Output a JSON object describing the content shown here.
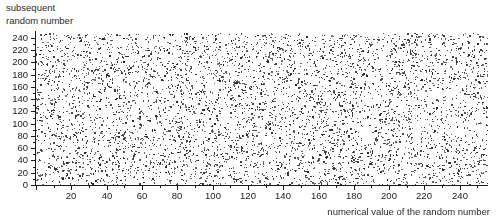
{
  "chart_data": {
    "type": "scatter",
    "title": "",
    "xlabel": "numerical value of the random number",
    "ylabel_lines": [
      "subsequent",
      "random number"
    ],
    "ylabel": "subsequent random number",
    "xlim": [
      0,
      256
    ],
    "ylim": [
      0,
      248
    ],
    "xticks": [
      0,
      20,
      40,
      60,
      80,
      100,
      120,
      140,
      160,
      180,
      200,
      220,
      240
    ],
    "yticks": [
      0,
      20,
      40,
      60,
      80,
      100,
      120,
      140,
      160,
      180,
      200,
      220,
      240
    ],
    "xtick_labels": [
      "",
      "20",
      "40",
      "60",
      "80",
      "100",
      "120",
      "140",
      "160",
      "180",
      "200",
      "220",
      "240"
    ],
    "ytick_labels": [
      "0",
      "20",
      "40",
      "60",
      "80",
      "100",
      "120",
      "140",
      "160",
      "180",
      "200",
      "220",
      "240"
    ],
    "minor_tick_step": 10,
    "grid": false,
    "legend": null,
    "marker": "square",
    "marker_size_px": 1.3,
    "marker_color": "#262626",
    "n_points": 5200,
    "distribution": "uniform",
    "seed": 20240607
  },
  "colors": {
    "background": "#ffffff",
    "axis": "#1a1a1a",
    "text": "#2b2b2b",
    "point": "#262626"
  }
}
